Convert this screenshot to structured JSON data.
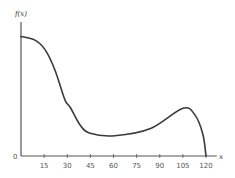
{
  "chart_data": {
    "type": "line",
    "title": "",
    "xlabel": "x",
    "ylabel": "f(x)",
    "origin_label": "0",
    "x_ticks": [
      15,
      30,
      45,
      60,
      75,
      90,
      105,
      120
    ],
    "xlim": [
      0,
      127
    ],
    "ylim": [
      0,
      105
    ],
    "grid": false,
    "legend": null,
    "series": [
      {
        "name": "f(x)",
        "x": [
          0,
          9,
          15.6,
          22,
          28.5,
          31.8,
          38.3,
          44.8,
          61,
          84,
          105,
          113,
          118,
          120
        ],
        "values": [
          100,
          97,
          89,
          72,
          47,
          41,
          26,
          19,
          17,
          23,
          40,
          34,
          18,
          0
        ]
      }
    ]
  },
  "colors": {
    "curve": "#3a3a3a",
    "axis": "#555555",
    "text": "#555555"
  }
}
